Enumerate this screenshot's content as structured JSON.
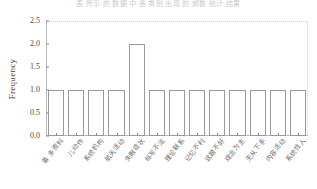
{
  "figure": {
    "top_caption": "表 所示 的 数据 中 各 类别 出现 的 频数 统计 结果"
  },
  "chart_data": {
    "type": "bar",
    "title": "",
    "xlabel": "",
    "ylabel": "Frequency",
    "ylim": [
      0.0,
      2.5
    ],
    "yticks": [
      "0.0",
      "0.5",
      "1.0",
      "1.5",
      "2.0",
      "2.5"
    ],
    "ytick_values": [
      0.0,
      0.5,
      1.0,
      1.5,
      2.0,
      2.5
    ],
    "grid": "dotted top and right frame only",
    "legend": "none",
    "categories": [
      "备 多资料",
      "儿动作",
      "系统机构",
      "航天活动",
      "失眠症状",
      "标写不法",
      "理论联系",
      "记忆不利",
      "这题不好",
      "观念为主",
      "无从下手",
      "内容活动",
      "系统性人"
    ],
    "values": [
      1.0,
      1.0,
      1.0,
      1.0,
      2.0,
      1.0,
      1.0,
      1.0,
      1.0,
      1.0,
      1.0,
      1.0,
      1.0
    ],
    "colors": {
      "bar_fill": "#ffffff",
      "bar_edge": "#9a9a9a",
      "axis": "#b9b9b9",
      "grid": "#cfcfcf",
      "text": "#4a4a4a"
    }
  }
}
